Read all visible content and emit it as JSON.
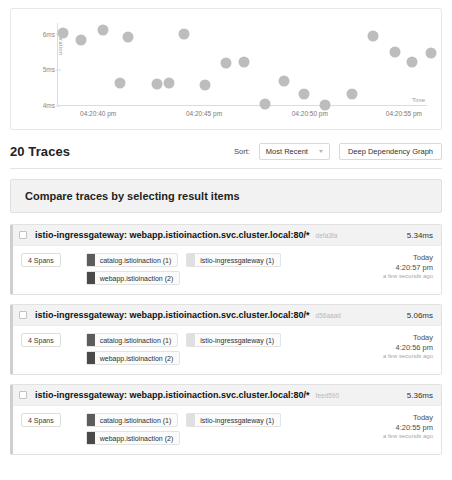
{
  "chart_data": {
    "type": "scatter",
    "title": "",
    "xlabel": "Time",
    "ylabel": "Duration",
    "ylim": [
      4,
      6.3
    ],
    "y_ticks": [
      "6ms",
      "5ms",
      "4ms"
    ],
    "y_tick_values": [
      6,
      5,
      4
    ],
    "x_ticks": [
      "04:20:40 pm",
      "04:20:45 pm",
      "04:20:50 pm",
      "04:20:55 pm"
    ],
    "grid": false,
    "legend": "none",
    "point_color": "#bdbdbd",
    "points": [
      {
        "x": 0.015,
        "y": 6.02
      },
      {
        "x": 0.06,
        "y": 5.83
      },
      {
        "x": 0.118,
        "y": 6.1
      },
      {
        "x": 0.18,
        "y": 5.92
      },
      {
        "x": 0.16,
        "y": 4.62
      },
      {
        "x": 0.255,
        "y": 4.58
      },
      {
        "x": 0.285,
        "y": 4.63
      },
      {
        "x": 0.325,
        "y": 5.98
      },
      {
        "x": 0.378,
        "y": 4.55
      },
      {
        "x": 0.432,
        "y": 5.18
      },
      {
        "x": 0.478,
        "y": 5.22
      },
      {
        "x": 0.53,
        "y": 4.02
      },
      {
        "x": 0.578,
        "y": 4.68
      },
      {
        "x": 0.63,
        "y": 4.3
      },
      {
        "x": 0.683,
        "y": 3.99
      },
      {
        "x": 0.752,
        "y": 4.32
      },
      {
        "x": 0.805,
        "y": 5.94
      },
      {
        "x": 0.862,
        "y": 5.48
      },
      {
        "x": 0.905,
        "y": 5.2
      },
      {
        "x": 0.955,
        "y": 5.45
      }
    ]
  },
  "results": {
    "count_label": "20 Traces",
    "sort_label": "Sort:",
    "sort_value": "Most Recent",
    "sort_options": [
      "Most Recent"
    ],
    "ddg_button": "Deep Dependency Graph"
  },
  "compare_banner": {
    "text": "Compare traces by selecting result items"
  },
  "traces": [
    {
      "title": "istio-ingressgateway: webapp.istioinaction.svc.cluster.local:80/*",
      "trace_id": "defa3fa",
      "duration": "5.34ms",
      "spans": "4 Spans",
      "services": [
        {
          "name": "catalog.istioinaction (1)",
          "color": "#5c5c5c"
        },
        {
          "name": "istio-ingressgateway (1)",
          "color": "#e0e0e0"
        },
        {
          "name": "webapp.istioinaction (2)",
          "color": "#4a4a4a"
        }
      ],
      "day": "Today",
      "time": "4:20:57 pm",
      "relative": "a few seconds ago"
    },
    {
      "title": "istio-ingressgateway: webapp.istioinaction.svc.cluster.local:80/*",
      "trace_id": "d56aaad",
      "duration": "5.06ms",
      "spans": "4 Spans",
      "services": [
        {
          "name": "catalog.istioinaction (1)",
          "color": "#5c5c5c"
        },
        {
          "name": "istio-ingressgateway (1)",
          "color": "#e0e0e0"
        },
        {
          "name": "webapp.istioinaction (2)",
          "color": "#4a4a4a"
        }
      ],
      "day": "Today",
      "time": "4:20:56 pm",
      "relative": "a few seconds ago"
    },
    {
      "title": "istio-ingressgateway: webapp.istioinaction.svc.cluster.local:80/*",
      "trace_id": "feed590",
      "duration": "5.36ms",
      "spans": "4 Spans",
      "services": [
        {
          "name": "catalog.istioinaction (1)",
          "color": "#5c5c5c"
        },
        {
          "name": "istio-ingressgateway (1)",
          "color": "#e0e0e0"
        },
        {
          "name": "webapp.istioinaction (2)",
          "color": "#4a4a4a"
        }
      ],
      "day": "Today",
      "time": "4:20:55 pm",
      "relative": "a few seconds ago"
    }
  ]
}
